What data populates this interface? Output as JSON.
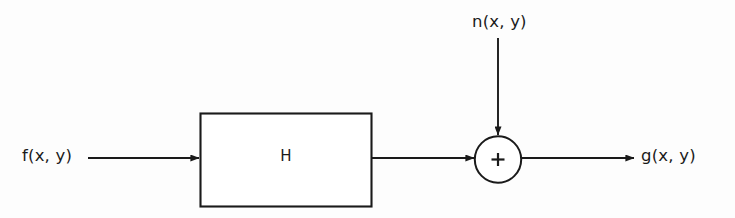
{
  "figure": {
    "type": "block-diagram",
    "background_color": "#fdfdfd",
    "stroke_color": "#1a1a1a",
    "text_color": "#1a1a1a",
    "width": 735,
    "height": 218
  },
  "nodes": {
    "input_label": {
      "name": "input-signal-label",
      "text": "f(x, y)",
      "x": 22,
      "y": 148
    },
    "noise_label": {
      "name": "noise-signal-label",
      "text": "n(x, y)",
      "x": 472,
      "y": 14
    },
    "output_label": {
      "name": "output-signal-label",
      "text": "g(x, y)",
      "x": 641,
      "y": 148
    },
    "system_block": {
      "name": "degradation-function-block",
      "text": "H",
      "x": 200,
      "y": 113,
      "width": 172,
      "height": 94
    },
    "summing_junction": {
      "name": "summing-junction",
      "operator": "+",
      "cx": 498,
      "cy": 160,
      "r": 23.5
    }
  },
  "connections": [
    {
      "name": "input-arrow",
      "from": "f(x, y)",
      "to": "H",
      "orientation": "horizontal",
      "x1": 88,
      "y1": 158,
      "x2": 200,
      "y2": 158
    },
    {
      "name": "system-to-sum-arrow",
      "from": "H",
      "to": "+",
      "orientation": "horizontal",
      "x1": 372,
      "y1": 158,
      "x2": 474,
      "y2": 158
    },
    {
      "name": "noise-arrow",
      "from": "n(x, y)",
      "to": "+",
      "orientation": "vertical",
      "x1": 498,
      "y1": 38,
      "x2": 498,
      "y2": 135
    },
    {
      "name": "output-arrow",
      "from": "+",
      "to": "g(x, y)",
      "orientation": "horizontal",
      "x1": 522,
      "y1": 158,
      "x2": 634,
      "y2": 158
    }
  ]
}
